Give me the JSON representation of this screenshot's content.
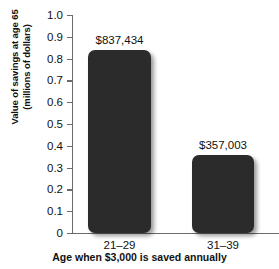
{
  "chart_data": {
    "type": "bar",
    "title": "",
    "xlabel": "Age when $3,000 is saved annually",
    "ylabel_line1": "Value of savings at age 65",
    "ylabel_line2": "(millions of dollars)",
    "categories": [
      "21–29",
      "31–39"
    ],
    "values": [
      0.837434,
      0.357003
    ],
    "value_labels": [
      "$837,434",
      "$357,003"
    ],
    "ylim": [
      0,
      1.0
    ],
    "ytick_values": [
      1.0,
      0.9,
      0.8,
      0.7,
      0.6,
      0.5,
      0.4,
      0.3,
      0.2,
      0.1,
      0
    ],
    "ytick_labels": [
      "1.0",
      "0.9",
      "0.8",
      "0.7",
      "0.6",
      "0.5",
      "0.4",
      "0.3",
      "0.2",
      "0.1",
      "0"
    ],
    "grid": false,
    "legend": "none",
    "bar_color": "#2b2b2b",
    "axis_color": "#6b6b6b",
    "text_color": "#111111",
    "background": "#ffffff"
  }
}
